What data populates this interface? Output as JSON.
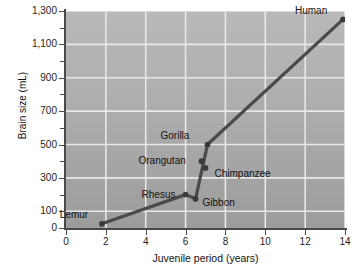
{
  "chart_data": {
    "type": "line",
    "title": "",
    "xlabel": "Juvenile period (years)",
    "ylabel": "Brain size (mL)",
    "xlim": [
      0,
      14
    ],
    "ylim": [
      0,
      1300
    ],
    "grid": true,
    "legend": "none",
    "x_ticks": [
      "0",
      "2",
      "4",
      "6",
      "8",
      "10",
      "12",
      "14"
    ],
    "x_tick_values": [
      0,
      2,
      4,
      6,
      8,
      10,
      12,
      14
    ],
    "y_ticks": [
      "0",
      "100",
      "300",
      "500",
      "700",
      "900",
      "1,100",
      "1,300"
    ],
    "y_tick_values": [
      0,
      100,
      300,
      500,
      700,
      900,
      1100,
      1300
    ],
    "y_minor_tick_values": [
      200,
      400,
      600,
      800,
      1000,
      1200
    ],
    "series": [
      {
        "name": "Primate brain size vs juvenile period",
        "points": [
          {
            "label": "Lemur",
            "x": 1.8,
            "y": 25,
            "label_dx": -42,
            "label_dy": -14
          },
          {
            "label": "Rhesus",
            "x": 6.0,
            "y": 200,
            "label_dx": -44,
            "label_dy": -5
          },
          {
            "label": "Gibbon",
            "x": 6.5,
            "y": 175,
            "label_dx": 7,
            "label_dy": -1
          },
          {
            "label": "Orangutan",
            "x": 6.8,
            "y": 400,
            "label_dx": -63,
            "label_dy": -5
          },
          {
            "label": "Gorilla",
            "x": 7.1,
            "y": 500,
            "label_dx": -47,
            "label_dy": -14
          },
          {
            "label": "Chimpanzee",
            "x": 7.0,
            "y": 360,
            "label_dx": 9,
            "label_dy": 1
          },
          {
            "label": "Human",
            "x": 13.9,
            "y": 1250,
            "label_dx": -48,
            "label_dy": -13
          }
        ],
        "line_path_x": [
          1.8,
          6.0,
          6.5,
          7.1,
          13.9
        ],
        "line_path_y": [
          25,
          200,
          175,
          500,
          1250
        ]
      }
    ],
    "colors": {
      "plot_background_top": "#b9b9b9",
      "plot_background_bottom": "#9c9c9c",
      "gridline": "#e8e8e8",
      "line": "#4a4a4a",
      "marker": "#3a3a3a",
      "axis": "#4a4a4a",
      "text": "#111111",
      "page_background": "#ffffff"
    }
  }
}
